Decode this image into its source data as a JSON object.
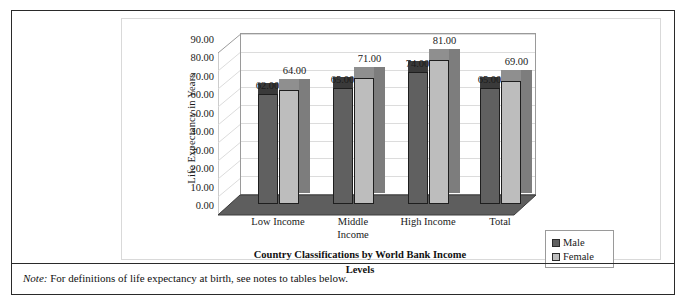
{
  "chart_data": {
    "type": "bar",
    "title": "",
    "subtitle": "",
    "xlabel": "Country Classifications by World Bank Income Levels",
    "ylabel": "Life Expectancy in Years",
    "ylim": [
      0,
      90
    ],
    "ytick_step": 10,
    "ytick_labels": [
      "0.00",
      "10.00",
      "20.00",
      "30.00",
      "40.00",
      "50.00",
      "60.00",
      "70.00",
      "80.00",
      "90.00"
    ],
    "categories": [
      "Low Income",
      "Middle Income",
      "High Income",
      "Total"
    ],
    "series": [
      {
        "name": "Male",
        "color": "#606060",
        "values": [
          62.0,
          65.0,
          74.0,
          65.0
        ],
        "labels": [
          "62.00",
          "65.00",
          "74.00",
          "65.00"
        ]
      },
      {
        "name": "Female",
        "color": "#bdbdbd",
        "values": [
          64.0,
          71.0,
          81.0,
          69.0
        ],
        "labels": [
          "64.00",
          "71.00",
          "81.00",
          "69.00"
        ]
      }
    ],
    "grid": true,
    "grid_axis": "y",
    "legend_position": "bottom-right",
    "three_d": true
  },
  "axis": {
    "y_title": "Life Expectancy in Years",
    "x_title_line1": "Country Classifications by World Bank Income",
    "x_title_line2": "Levels"
  },
  "categories_display": [
    {
      "line1": "Low Income",
      "line2": ""
    },
    {
      "line1": "Middle",
      "line2": "Income"
    },
    {
      "line1": "High Income",
      "line2": ""
    },
    {
      "line1": "Total",
      "line2": ""
    }
  ],
  "legend": {
    "items": [
      {
        "label": "Male",
        "color": "#606060"
      },
      {
        "label": "Female",
        "color": "#bdbdbd"
      }
    ]
  },
  "note": {
    "label": "Note:",
    "text": " For definitions of life expectancy at birth, see notes to tables below."
  }
}
